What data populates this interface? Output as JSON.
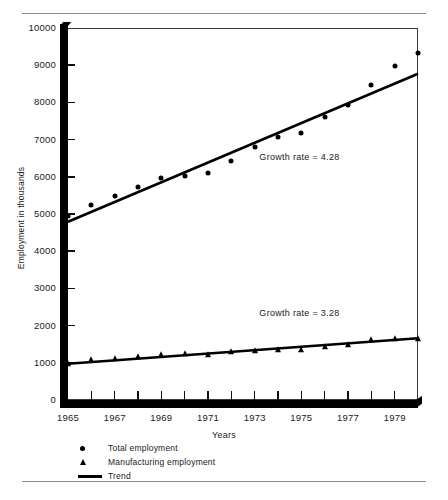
{
  "chart_data": {
    "type": "scatter",
    "title": "",
    "xlabel": "Years",
    "ylabel": "Employment in thousands",
    "xlim": [
      1965,
      1980
    ],
    "ylim": [
      0,
      10000
    ],
    "yticks": [
      0,
      1000,
      2000,
      3000,
      4000,
      5000,
      6000,
      7000,
      8000,
      9000,
      10000
    ],
    "ytick_labels": [
      "0",
      "1000",
      "2000",
      "3000",
      "4000",
      "5000",
      "6000",
      "7000",
      "8000",
      "9000",
      "10000"
    ],
    "xticks": [
      1965,
      1966,
      1967,
      1968,
      1969,
      1970,
      1971,
      1972,
      1973,
      1974,
      1975,
      1976,
      1977,
      1978,
      1979,
      1980
    ],
    "xtick_labels": [
      "1965",
      "",
      "1967",
      "",
      "1969",
      "",
      "1971",
      "",
      "1973",
      "",
      "1975",
      "",
      "1977",
      "",
      "1979",
      ""
    ],
    "grid": false,
    "legend_position": "below-axes",
    "x": [
      1965,
      1966,
      1967,
      1968,
      1969,
      1970,
      1971,
      1972,
      1973,
      1974,
      1975,
      1976,
      1977,
      1978,
      1979,
      1980
    ],
    "series": [
      {
        "name": "Total employment",
        "marker": "circle",
        "values": [
          4950,
          5230,
          5490,
          5720,
          5980,
          6020,
          6110,
          6420,
          6790,
          7080,
          7170,
          7610,
          7940,
          8470,
          8970,
          9330
        ]
      },
      {
        "name": "Manufacturing employment",
        "marker": "triangle",
        "values": [
          980,
          1070,
          1110,
          1150,
          1200,
          1240,
          1210,
          1280,
          1330,
          1350,
          1340,
          1420,
          1470,
          1600,
          1650,
          1640
        ]
      },
      {
        "name": "Trend",
        "marker": "line",
        "fit_total": {
          "start_year": 1965,
          "start_value": 4790,
          "end_year": 1980,
          "end_value": 8770
        },
        "fit_manufacturing": {
          "start_year": 1965,
          "start_value": 975,
          "end_year": 1980,
          "end_value": 1660
        }
      }
    ],
    "annotations": [
      {
        "text": "Growth rate  =  4.28",
        "x": 1973.2,
        "y": 6500
      },
      {
        "text": "Growth rate  =  3.28",
        "x": 1973.2,
        "y": 2300
      }
    ]
  },
  "legend": {
    "items": [
      {
        "label": "Total employment",
        "marker": "circle"
      },
      {
        "label": "Manufacturing employment",
        "marker": "triangle"
      },
      {
        "label": "Trend",
        "marker": "line"
      }
    ]
  },
  "axes": {
    "y_title": "Employment in thousands",
    "x_title": "Years"
  },
  "colors": {
    "ink": "#000000",
    "frame": "#3b3b3b",
    "rule": "#8d8d8d",
    "background": "#ffffff"
  }
}
